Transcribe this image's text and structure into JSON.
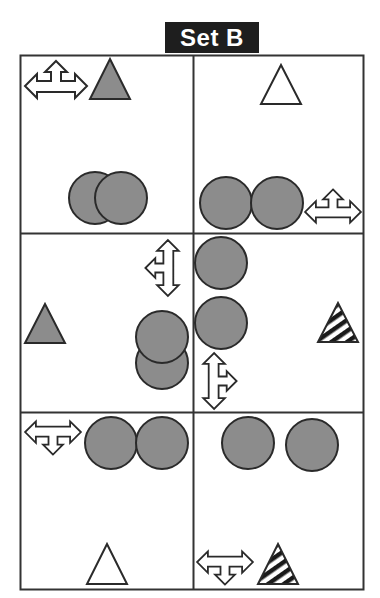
{
  "title": "Set B",
  "colors": {
    "title_bg": "#1e1e1e",
    "title_text": "#ffffff",
    "grid_line": "#333333",
    "shape_fill": "#8c8c8c",
    "shape_stroke": "#2a2a2a",
    "outline_fill": "#ffffff"
  },
  "grid": {
    "rows": 3,
    "cols": 2
  },
  "cells": [
    {
      "row": 1,
      "col": 1,
      "items": [
        {
          "type": "four-way-arrow",
          "variant": "up-left-right",
          "style": "outline"
        },
        {
          "type": "triangle",
          "style": "gray-filled"
        },
        {
          "type": "circle",
          "style": "gray-filled",
          "count": 2,
          "arrangement": "overlapping-horizontal"
        }
      ]
    },
    {
      "row": 1,
      "col": 2,
      "items": [
        {
          "type": "triangle",
          "style": "outline"
        },
        {
          "type": "circle",
          "style": "gray-filled",
          "count": 2,
          "arrangement": "touching-horizontal"
        },
        {
          "type": "four-way-arrow",
          "variant": "up-left-right",
          "style": "outline"
        }
      ]
    },
    {
      "row": 2,
      "col": 1,
      "items": [
        {
          "type": "four-way-arrow",
          "variant": "up-down-left",
          "style": "outline"
        },
        {
          "type": "triangle",
          "style": "gray-filled"
        },
        {
          "type": "circle",
          "style": "gray-filled",
          "count": 2,
          "arrangement": "overlapping-vertical"
        }
      ]
    },
    {
      "row": 2,
      "col": 2,
      "items": [
        {
          "type": "circle",
          "style": "gray-filled",
          "count": 2,
          "arrangement": "stacked-vertical"
        },
        {
          "type": "triangle",
          "style": "striped"
        },
        {
          "type": "four-way-arrow",
          "variant": "up-down-right",
          "style": "outline"
        }
      ]
    },
    {
      "row": 3,
      "col": 1,
      "items": [
        {
          "type": "four-way-arrow",
          "variant": "down-left-right",
          "style": "outline"
        },
        {
          "type": "circle",
          "style": "gray-filled",
          "count": 2,
          "arrangement": "touching-horizontal"
        },
        {
          "type": "triangle",
          "style": "outline"
        }
      ]
    },
    {
      "row": 3,
      "col": 2,
      "items": [
        {
          "type": "circle",
          "style": "gray-filled",
          "count": 2,
          "arrangement": "separated-horizontal"
        },
        {
          "type": "four-way-arrow",
          "variant": "down-left-right",
          "style": "outline"
        },
        {
          "type": "triangle",
          "style": "striped"
        }
      ]
    }
  ]
}
